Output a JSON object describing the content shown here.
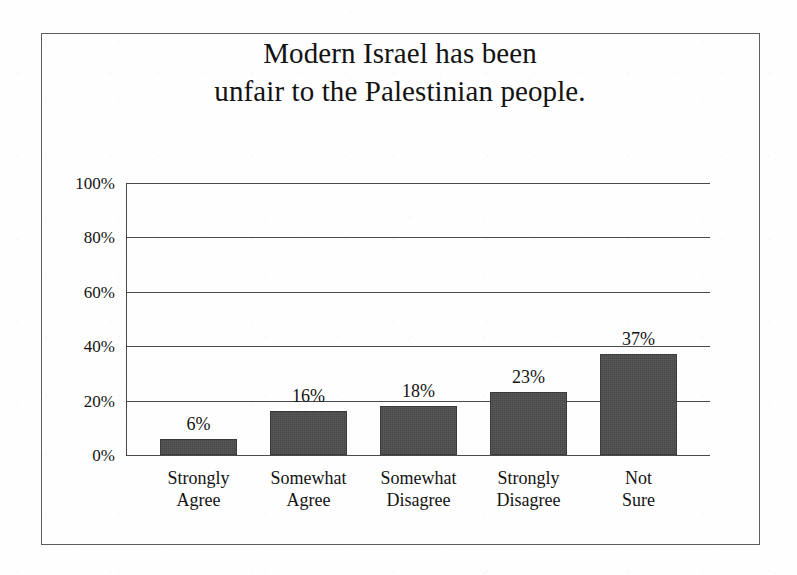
{
  "figure": {
    "title_line_1": "Modern Israel has been",
    "title_line_2": "unfair to the Palestinian people.",
    "frame_color": "#5d5d5d",
    "background_color": "#fefefe"
  },
  "chart_data": {
    "type": "bar",
    "title": "Modern Israel has been unfair to the Palestinian people.",
    "xlabel": "",
    "ylabel": "",
    "ylim": [
      0,
      100
    ],
    "yticks": [
      0,
      20,
      40,
      60,
      80,
      100
    ],
    "ytick_labels": [
      "0%",
      "20%",
      "40%",
      "60%",
      "80%",
      "100%"
    ],
    "grid": true,
    "legend": false,
    "bar_color": "#474747",
    "categories": [
      "Strongly Agree",
      "Somewhat Agree",
      "Somewhat Disagree",
      "Strongly Disagree",
      "Not Sure"
    ],
    "category_lines": [
      [
        "Strongly",
        "Agree"
      ],
      [
        "Somewhat",
        "Agree"
      ],
      [
        "Somewhat",
        "Disagree"
      ],
      [
        "Strongly",
        "Disagree"
      ],
      [
        "Not",
        "Sure"
      ]
    ],
    "values": [
      6,
      16,
      18,
      23,
      37
    ],
    "value_labels": [
      "6%",
      "16%",
      "18%",
      "23%",
      "37%"
    ]
  }
}
